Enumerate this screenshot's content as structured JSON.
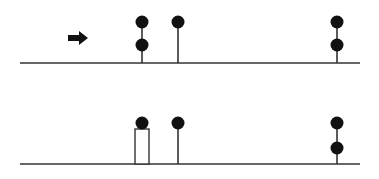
{
  "diagram": {
    "colors": {
      "stroke": "#333333",
      "ball": "#111111",
      "background": "#ffffff"
    },
    "ball_radius": 6.5,
    "arrow": {
      "x1": 68,
      "x2": 88,
      "y": 38,
      "direction": "right"
    },
    "panels": [
      {
        "id": "top",
        "baseline": {
          "y": 63,
          "x1": 20,
          "x2": 360
        },
        "stems": [
          {
            "x": 142,
            "top_y": 22,
            "balls_y": [
              22,
              45
            ]
          },
          {
            "x": 178,
            "top_y": 22,
            "balls_y": [
              22
            ]
          },
          {
            "x": 337,
            "top_y": 22,
            "balls_y": [
              22,
              45
            ]
          }
        ],
        "boxes": []
      },
      {
        "id": "bottom",
        "baseline": {
          "y": 164,
          "x1": 20,
          "x2": 360
        },
        "stems": [
          {
            "x": 178,
            "top_y": 123,
            "balls_y": [
              123
            ]
          },
          {
            "x": 337,
            "top_y": 123,
            "balls_y": [
              123,
              148
            ]
          }
        ],
        "boxes": [
          {
            "x": 135,
            "y": 129,
            "width": 14,
            "height": 35,
            "ball_y": 123,
            "ball_x": 142
          }
        ]
      }
    ]
  }
}
